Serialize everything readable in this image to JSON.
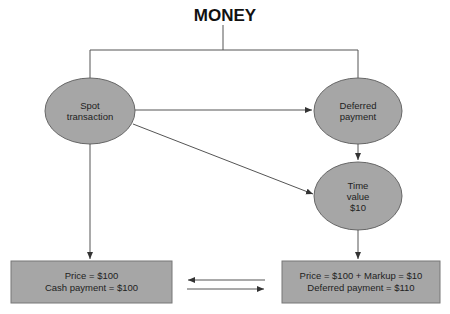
{
  "title": "MONEY",
  "nodes": {
    "spot": {
      "line1": "Spot",
      "line2": "transaction"
    },
    "deferred": {
      "line1": "Deferred",
      "line2": "payment"
    },
    "time_value": {
      "line1": "Time",
      "line2": "value",
      "line3": "$10"
    }
  },
  "boxes": {
    "left": {
      "line1": "Price = $100",
      "line2": "Cash payment = $100"
    },
    "right": {
      "line1": "Price = $100 + Markup = $10",
      "line2": "Deferred payment = $110"
    }
  },
  "colors": {
    "node_fill": "#a6a6a6",
    "box_fill": "#a6a6a6",
    "stroke": "#555555"
  }
}
